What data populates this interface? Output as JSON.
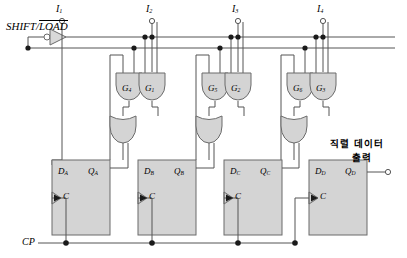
{
  "diagram": {
    "control": {
      "shift_load_pre": "SHIFT/",
      "shift_load_bar": "LOAD",
      "clock_label": "CP"
    },
    "parallel_inputs": [
      {
        "name": "I",
        "sub": "1"
      },
      {
        "name": "I",
        "sub": "2"
      },
      {
        "name": "I",
        "sub": "3"
      },
      {
        "name": "I",
        "sub": "4"
      }
    ],
    "and_gates": [
      {
        "name": "G",
        "sub": "4"
      },
      {
        "name": "G",
        "sub": "1"
      },
      {
        "name": "G",
        "sub": "5"
      },
      {
        "name": "G",
        "sub": "2"
      },
      {
        "name": "G",
        "sub": "6"
      },
      {
        "name": "G",
        "sub": "3"
      }
    ],
    "flipflops": [
      {
        "d": "D",
        "d_sub": "A",
        "q": "Q",
        "q_sub": "A",
        "clk": "C"
      },
      {
        "d": "D",
        "d_sub": "B",
        "q": "Q",
        "q_sub": "B",
        "clk": "C"
      },
      {
        "d": "D",
        "d_sub": "C",
        "q": "Q",
        "q_sub": "C",
        "clk": "C"
      },
      {
        "d": "D",
        "d_sub": "D",
        "q": "Q",
        "q_sub": "D",
        "clk": "C"
      }
    ],
    "output": {
      "line1": "직렬 데이터",
      "line2": "출력"
    },
    "colors": {
      "gate_fill": "#d4d4d4",
      "gate_stroke": "#6b6b6b",
      "ff_fill": "#d4d4d4",
      "ff_stroke": "#6b6b6b",
      "wire": "#555555",
      "node": "#1a1a1a",
      "text": "#000000",
      "background": "#ffffff"
    }
  }
}
